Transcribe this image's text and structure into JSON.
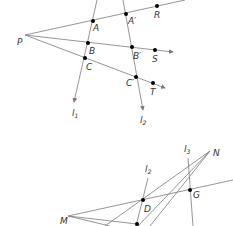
{
  "figure_top": {
    "center_point": {
      "label": "P",
      "x": 25,
      "y": 35
    },
    "lines": [
      {
        "label": "l",
        "subscript": "1"
      },
      {
        "label": "l",
        "subscript": "2"
      }
    ],
    "points": [
      {
        "label": "A",
        "x": 93,
        "y": 21
      },
      {
        "label": "B",
        "x": 88,
        "y": 43
      },
      {
        "label": "C",
        "x": 85,
        "y": 58
      },
      {
        "label": "A′",
        "x": 126,
        "y": 14
      },
      {
        "label": "B′",
        "x": 132,
        "y": 47
      },
      {
        "label": "C′",
        "x": 136,
        "y": 77
      },
      {
        "label": "R",
        "x": 157,
        "y": 6
      },
      {
        "label": "S",
        "x": 155,
        "y": 50
      },
      {
        "label": "T",
        "x": 153,
        "y": 83
      }
    ]
  },
  "figure_bottom": {
    "points": [
      {
        "label": "N",
        "x": 210,
        "y": 151
      },
      {
        "label": "M",
        "x": 68,
        "y": 216
      },
      {
        "label": "D",
        "x": 143,
        "y": 200
      },
      {
        "label": "G",
        "x": 190,
        "y": 190
      }
    ],
    "lines": [
      {
        "label": "l",
        "subscript": "2"
      },
      {
        "label": "l",
        "subscript": "3"
      }
    ]
  },
  "colors": {
    "line": "#7a7a7a",
    "point": "#000000",
    "label": "#333333"
  }
}
